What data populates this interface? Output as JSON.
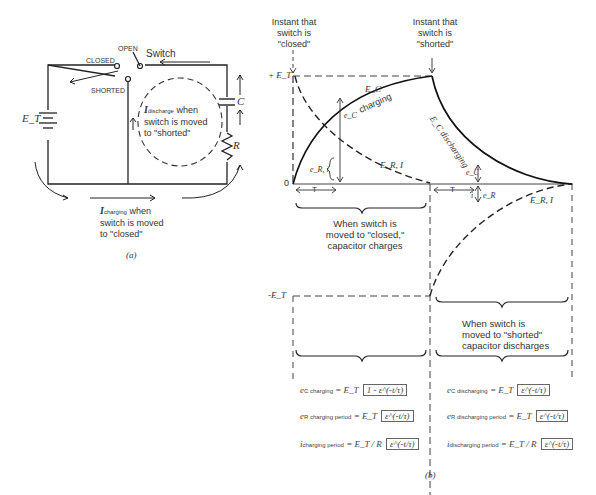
{
  "circuit": {
    "switch_label": "Switch",
    "open_label": "OPEN",
    "closed_label": "CLOSED",
    "shorted_label": "SHORTED",
    "source_label": "E_T",
    "capacitor_label": "C",
    "resistor_label": "R",
    "discharge_note": {
      "symbol": "I",
      "subscript": "discharge",
      "text_line1": "when",
      "text_line2": "switch is moved",
      "text_line3": "to \"shorted\""
    },
    "charging_note": {
      "symbol": "I",
      "subscript": "charging",
      "text_line1": "when",
      "text_line2": "switch is moved",
      "text_line3": "to \"closed\""
    },
    "caption": "(a)"
  },
  "graph": {
    "instant_closed": [
      "Instant that",
      "switch is",
      "\"closed\""
    ],
    "instant_shorted": [
      "Instant that",
      "switch is",
      "\"shorted\""
    ],
    "plus_et": "+ E_T",
    "minus_et": "-E_T",
    "origin": "0",
    "tau_label": "T",
    "ec_charging_line1": "E_C",
    "ec_charging_line2": "charging",
    "ec_discharging": "E_C discharging",
    "ec_symbol": "e_C",
    "er_symbol": "e_R",
    "i_symbol": "i",
    "er_i_charging": "E_R, I",
    "er_i_discharging": "E_R, I",
    "er_i_small": "e_R, i",
    "charging_desc": [
      "When switch is",
      "moved to \"closed,\"",
      "capacitor charges"
    ],
    "discharging_desc": [
      "When switch is",
      "moved to \"shorted\"",
      "capacitor discharges"
    ],
    "caption": "(b)"
  },
  "equations": {
    "charging": [
      {
        "lhs": "e",
        "lhs_sub": "C charging",
        "rhs": "= E_T",
        "bracket": "1 - ε^(-t/τ)"
      },
      {
        "lhs": "e",
        "lhs_sub": "R charging period",
        "rhs": "= E_T",
        "bracket": "ε^(-t/τ)"
      },
      {
        "lhs": "i",
        "lhs_sub": "charging period",
        "rhs": "= E_T / R",
        "bracket": "ε^(-t/τ)"
      }
    ],
    "discharging": [
      {
        "lhs": "e",
        "lhs_sub": "C discharging",
        "rhs": "= E_T",
        "bracket": "ε^(-t/τ)"
      },
      {
        "lhs": "e",
        "lhs_sub": "R discharging period",
        "rhs": "= E_T",
        "bracket": "ε^(-t/τ)"
      },
      {
        "lhs": "i",
        "lhs_sub": "discharging period",
        "rhs": "= E_T / R",
        "bracket": "ε^(-t/τ)"
      }
    ]
  }
}
